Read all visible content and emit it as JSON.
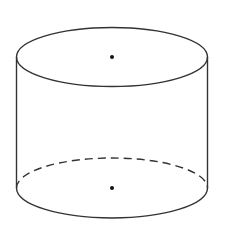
{
  "diagram": {
    "type": "cylinder",
    "colors": {
      "stroke": "#333333",
      "fill": "#ffffff",
      "dot": "#111111"
    },
    "top_base": {
      "cx": 112,
      "cy": 57,
      "rx": 95.5,
      "ry": 29.5
    },
    "bottom_base": {
      "cx": 112,
      "cy": 188,
      "rx": 95.5,
      "ry": 30
    },
    "top_center_dot": {
      "x": 112,
      "y": 57
    },
    "bottom_center_dot": {
      "x": 112,
      "y": 188
    },
    "dash_pattern": "8 5"
  }
}
